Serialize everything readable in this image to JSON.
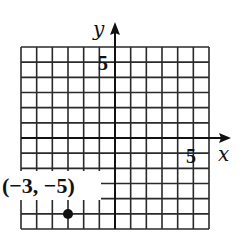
{
  "chart_data": {
    "type": "scatter",
    "title": "",
    "xlabel": "x",
    "ylabel": "y",
    "xlim": [
      -6,
      6
    ],
    "ylim": [
      -6,
      6
    ],
    "grid": true,
    "x_tick_labels": [
      {
        "value": 5,
        "label": "5"
      }
    ],
    "y_tick_labels": [
      {
        "value": 5,
        "label": "5"
      }
    ],
    "series": [
      {
        "name": "point",
        "points": [
          {
            "x": -3,
            "y": -5
          }
        ]
      }
    ],
    "annotations": [
      {
        "text": "(−3, −5)",
        "x": -3,
        "y": -5
      }
    ]
  },
  "labels": {
    "x_axis": "x",
    "y_axis": "y",
    "x_tick": "5",
    "y_tick": "5",
    "point": "(−3, −5)"
  }
}
